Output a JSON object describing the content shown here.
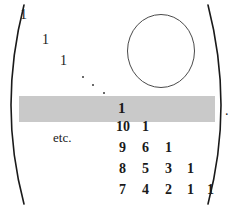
{
  "figure": {
    "type": "matrix-expression",
    "bracket_left": "(",
    "bracket_right": ")",
    "trailing_punctuation": ".",
    "etc_label": "etc.",
    "highlight_color": "#c9c9c9",
    "ink_color": "#1a1a1a",
    "circle_annotation": {
      "name": "circle-annotation",
      "stroke_color": "#4a4a4a"
    },
    "diagonal_ones": [
      {
        "value": "1",
        "x": 20,
        "y": 8
      },
      {
        "value": "1",
        "x": 42,
        "y": 33
      },
      {
        "value": "1",
        "x": 60,
        "y": 54
      }
    ],
    "ellipsis_dots": [
      {
        "x": 82,
        "y": 76
      },
      {
        "x": 92,
        "y": 84
      },
      {
        "x": 103,
        "y": 92
      }
    ],
    "rows": [
      {
        "name": "highlighted-row",
        "highlighted": true,
        "y": 101,
        "cells": [
          {
            "value": "1",
            "x": 118,
            "bold": true
          }
        ]
      },
      {
        "name": "row-10-1",
        "highlighted": false,
        "y": 120,
        "cells": [
          {
            "value": "10",
            "x": 116
          },
          {
            "value": "1",
            "x": 142
          }
        ]
      },
      {
        "name": "row-9-6-1",
        "highlighted": false,
        "y": 141,
        "cells": [
          {
            "value": "9",
            "x": 119
          },
          {
            "value": "6",
            "x": 142
          },
          {
            "value": "1",
            "x": 165
          }
        ]
      },
      {
        "name": "row-8-5-3-1",
        "highlighted": false,
        "y": 162,
        "cells": [
          {
            "value": "8",
            "x": 119
          },
          {
            "value": "5",
            "x": 142
          },
          {
            "value": "3",
            "x": 165
          },
          {
            "value": "1",
            "x": 187
          }
        ]
      },
      {
        "name": "row-7-4-2-1-1",
        "highlighted": false,
        "y": 183,
        "cells": [
          {
            "value": "7",
            "x": 119
          },
          {
            "value": "4",
            "x": 142
          },
          {
            "value": "2",
            "x": 165
          },
          {
            "value": "1",
            "x": 187
          },
          {
            "value": "1",
            "x": 207
          }
        ]
      }
    ]
  }
}
